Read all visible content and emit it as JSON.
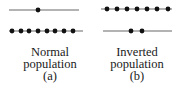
{
  "panels": [
    {
      "id": "a",
      "caption_line1": "Normal",
      "caption_line2": "population",
      "label": "(a)",
      "upper_level": {
        "y": 10,
        "x1": 9,
        "x2": 79,
        "particles_x": [
          38
        ]
      },
      "lower_level": {
        "y": 31,
        "x1": 9,
        "x2": 83,
        "particles_x": [
          12,
          21,
          29,
          38,
          47,
          55,
          64,
          73
        ]
      }
    },
    {
      "id": "b",
      "caption_line1": "Inverted",
      "caption_line2": "population",
      "label": "(b)",
      "upper_level": {
        "y": 9,
        "x1": 101,
        "x2": 172,
        "particles_x": [
          107,
          117,
          127,
          137,
          147,
          157,
          168
        ]
      },
      "lower_level": {
        "y": 31,
        "x1": 103,
        "x2": 172,
        "particles_x": [
          131,
          142
        ]
      }
    }
  ],
  "colors": {
    "line": "#9a9a9a",
    "dot": "#111111",
    "text": "#1a1a1a"
  }
}
